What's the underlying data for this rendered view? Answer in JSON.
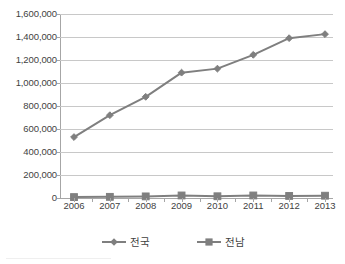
{
  "chart_data": {
    "type": "line",
    "title": "",
    "subtitle": "",
    "xlabel": "",
    "ylabel": "",
    "categories": [
      "2006",
      "2007",
      "2008",
      "2009",
      "2010",
      "2011",
      "2012",
      "2013"
    ],
    "ylim": [
      0,
      1600000
    ],
    "y_ticks": [
      0,
      200000,
      400000,
      600000,
      800000,
      1000000,
      1200000,
      1400000,
      1600000
    ],
    "y_tick_labels": [
      "0",
      "200,000",
      "400,000",
      "600,000",
      "800,000",
      "1,000,000",
      "1,200,000",
      "1,400,000",
      "1,600,000"
    ],
    "grid": "horizontal",
    "legend_position": "bottom-center",
    "series": [
      {
        "name": "전국",
        "marker": "diamond",
        "color": "#7f7f7f",
        "values": [
          530000,
          720000,
          880000,
          1090000,
          1125000,
          1245000,
          1390000,
          1425000
        ]
      },
      {
        "name": "전남",
        "marker": "square",
        "color": "#7f7f7f",
        "values": [
          8000,
          10000,
          14000,
          22000,
          15000,
          22000,
          18000,
          20000
        ]
      }
    ]
  },
  "legend": {
    "items": [
      {
        "label": "전국",
        "marker": "diamond"
      },
      {
        "label": "전남",
        "marker": "square"
      }
    ]
  },
  "colors": {
    "series_line": "#7f7f7f",
    "gridline": "#c8c8c8",
    "axis": "#a6a6a6",
    "text": "#3f3f3f",
    "background": "#ffffff"
  }
}
